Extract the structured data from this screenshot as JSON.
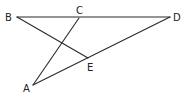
{
  "diagram": {
    "type": "geometry",
    "points": {
      "A": {
        "label": "A",
        "x": 33,
        "y": 85
      },
      "B": {
        "label": "B",
        "x": 17,
        "y": 17
      },
      "C": {
        "label": "C",
        "x": 79,
        "y": 18
      },
      "D": {
        "label": "D",
        "x": 170,
        "y": 17
      },
      "E": {
        "label": "E",
        "x": 88,
        "y": 58
      }
    },
    "segments": [
      {
        "from": "B",
        "to": "D"
      },
      {
        "from": "B",
        "to": "E"
      },
      {
        "from": "C",
        "to": "A"
      },
      {
        "from": "A",
        "to": "D"
      }
    ],
    "labels": {
      "A": "A",
      "B": "B",
      "C": "C",
      "D": "D",
      "E": "E"
    }
  }
}
